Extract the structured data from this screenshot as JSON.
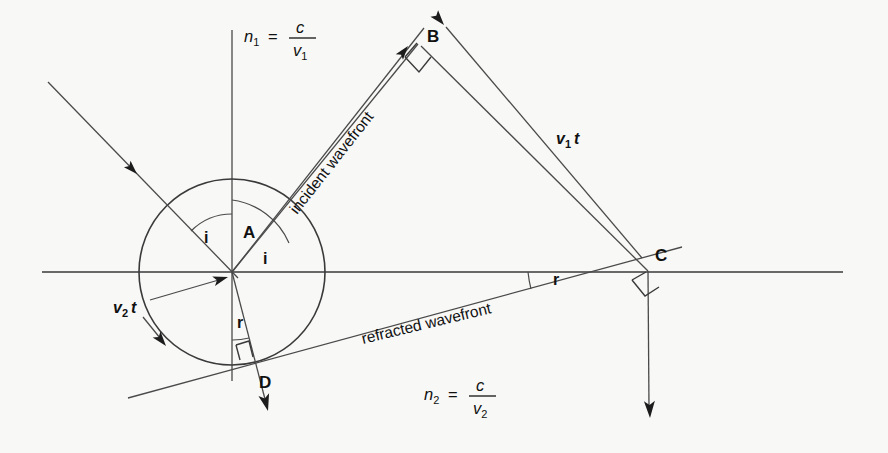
{
  "figure": {
    "background_color": "#f8f8f7",
    "ink_color": "#3a3a3a",
    "width": 888,
    "height": 453
  },
  "formulas": {
    "upper": {
      "symbol": "n",
      "symbol_sub": "1",
      "equals": "=",
      "numerator": "c",
      "denominator": "v",
      "denominator_sub": "1",
      "full_text": "n1 = c/v1",
      "x": 244,
      "y": 42
    },
    "lower": {
      "symbol": "n",
      "symbol_sub": "2",
      "equals": "=",
      "numerator": "c",
      "denominator": "v",
      "denominator_sub": "2",
      "full_text": "n2 = c/v2",
      "x": 424,
      "y": 400
    }
  },
  "points": [
    {
      "id": "A",
      "label": "A",
      "x": 232,
      "y": 272,
      "label_x": 243,
      "label_y": 238
    },
    {
      "id": "B",
      "label": "B",
      "x": 415,
      "y": 40,
      "label_x": 427,
      "label_y": 42
    },
    {
      "id": "C",
      "label": "C",
      "x": 648,
      "y": 271,
      "label_x": 655,
      "label_y": 261
    },
    {
      "id": "D",
      "label": "D",
      "x": 250,
      "y": 370,
      "label_x": 259,
      "label_y": 388
    }
  ],
  "angles": [
    {
      "id": "i-left",
      "label": "i",
      "x": 204,
      "y": 243
    },
    {
      "id": "i-right",
      "label": "i",
      "x": 263,
      "y": 264
    },
    {
      "id": "r-left",
      "label": "r",
      "x": 237,
      "y": 328
    },
    {
      "id": "r-right",
      "label": "r",
      "x": 553,
      "y": 285
    }
  ],
  "vectors": [
    {
      "id": "v1t",
      "base": "v",
      "sub": "1",
      "suffix": "t",
      "full_text": "v1 t",
      "x": 556,
      "y": 144,
      "description": "distance travelled by wavefront in medium 1"
    },
    {
      "id": "v2t",
      "base": "v",
      "sub": "2",
      "suffix": "t",
      "full_text": "v2 t",
      "x": 113,
      "y": 313,
      "description": "radius of Huygens wavelet in medium 2"
    }
  ],
  "wavefronts": [
    {
      "id": "incident",
      "label": "incident wavefront",
      "x": 297,
      "y": 215,
      "rotation": -51.8
    },
    {
      "id": "refracted",
      "label": "refracted wavefront",
      "x": 363,
      "y": 344,
      "rotation": -13.5
    }
  ],
  "geometry": {
    "interface_line": {
      "x1": 42,
      "y1": 272,
      "x2": 843,
      "y2": 272
    },
    "normal_line": {
      "x1": 232,
      "y1": 30,
      "x2": 232,
      "y2": 381
    },
    "circle": {
      "cx": 232,
      "cy": 272,
      "r": 93
    },
    "incident_ray_left": {
      "x1": 48,
      "y1": 82,
      "x2": 232,
      "y2": 272
    },
    "incident_ray_upper": {
      "x1": 232,
      "y1": 272,
      "x2": 424,
      "y2": 28
    },
    "incident_wavefront_BA": {
      "x1": 415,
      "y1": 40,
      "x2": 232,
      "y2": 272
    },
    "segment_BC": {
      "x1": 421,
      "y1": 46,
      "x2": 648,
      "y2": 271
    },
    "v1t_arrow": {
      "x1": 642,
      "y1": 258,
      "x2": 444,
      "y2": 25
    },
    "refracted_wavefront_line": {
      "x1": 128,
      "y1": 398,
      "x2": 680,
      "y2": 248
    },
    "refracted_ray_AD": {
      "x1": 232,
      "y1": 272,
      "x2": 268,
      "y2": 410
    },
    "refracted_ray_C": {
      "x1": 648,
      "y1": 271,
      "x2": 650,
      "y2": 418
    },
    "v2t_arrow_to_center": {
      "x1": 148,
      "y1": 300,
      "x2": 225,
      "y2": 278
    },
    "v2t_arrow_to_circle": {
      "x1": 146,
      "y1": 316,
      "x2": 166,
      "y2": 345
    }
  }
}
